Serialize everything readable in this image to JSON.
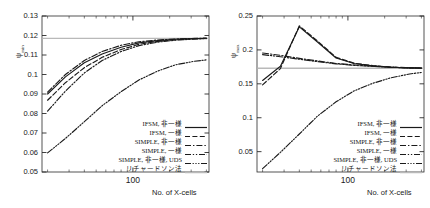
{
  "figure": {
    "panels": [
      {
        "id": "left",
        "ylabel": "ψ",
        "ylabel_sub": "min",
        "xlabel": "No. of X-cells"
      },
      {
        "id": "right",
        "ylabel": "ψ",
        "ylabel_sub": "max",
        "xlabel": "No. of X-cells"
      }
    ]
  },
  "legend": {
    "entries": [
      {
        "label": "IFSM, 非一様",
        "style": "solid"
      },
      {
        "label": "IFSM, 一様",
        "style": "dashed"
      },
      {
        "label": "SIMPLE, 非一様",
        "style": "dashdot"
      },
      {
        "label": "SIMPLE, 一様",
        "style": "dashdotdot"
      },
      {
        "label": "SIMPLE, 非一様, UDS",
        "style": "dashdotdotdot"
      },
      {
        "label": "リチャードソン法",
        "style": "reference"
      }
    ]
  },
  "chart_data": [
    {
      "type": "line",
      "id": "psi-min",
      "title": "",
      "xlabel": "No. of X-cells",
      "ylabel": "ψ_min",
      "xscale": "log",
      "xlim": [
        18,
        420
      ],
      "ylim": [
        0.05,
        0.13
      ],
      "yticks": [
        0.05,
        0.06,
        0.07,
        0.08,
        0.09,
        0.1,
        0.11,
        0.12,
        0.13
      ],
      "ytick_labels": [
        "0.05",
        "0.06",
        "0.07",
        "0.08",
        "0.09",
        "0.1",
        "0.11",
        "0.12",
        "0.13"
      ],
      "xticks": [
        100
      ],
      "xtick_labels": [
        "100"
      ],
      "grid": false,
      "legend_position": "lower-right",
      "reference_line": {
        "value": 0.1185,
        "label": "リチャードソン法"
      },
      "x": [
        20,
        28,
        40,
        56,
        80,
        112,
        160,
        224,
        320,
        400
      ],
      "series": [
        {
          "name": "IFSM, 非一様",
          "style": "solid",
          "values": [
            0.09,
            0.0988,
            0.106,
            0.1105,
            0.114,
            0.1162,
            0.1174,
            0.1181,
            0.1184,
            0.1186
          ]
        },
        {
          "name": "IFSM, 一様",
          "style": "dashed",
          "values": [
            0.0868,
            0.0958,
            0.1035,
            0.1088,
            0.1128,
            0.1155,
            0.117,
            0.1178,
            0.1183,
            0.1185
          ]
        },
        {
          "name": "SIMPLE, 非一様",
          "style": "dashdot",
          "values": [
            0.091,
            0.1,
            0.1072,
            0.1118,
            0.115,
            0.1168,
            0.1177,
            0.1182,
            0.1185,
            0.1187
          ]
        },
        {
          "name": "SIMPLE, 一様",
          "style": "dashdotdot",
          "values": [
            0.0812,
            0.0915,
            0.1008,
            0.1072,
            0.1118,
            0.1148,
            0.1166,
            0.1176,
            0.1182,
            0.1184
          ]
        },
        {
          "name": "SIMPLE, 非一様, UDS",
          "style": "dashdotdotdot",
          "values": [
            0.0598,
            0.0672,
            0.0758,
            0.084,
            0.0912,
            0.0972,
            0.1018,
            0.105,
            0.1068,
            0.1075
          ]
        }
      ]
    },
    {
      "type": "line",
      "id": "psi-max",
      "title": "",
      "xlabel": "No. of X-cells",
      "ylabel": "ψ_max",
      "xscale": "log",
      "xlim": [
        18,
        420
      ],
      "ylim": [
        0.02,
        0.25
      ],
      "yticks": [
        0.05,
        0.1,
        0.15,
        0.2,
        0.25
      ],
      "ytick_labels": [
        "0.05",
        "0.1",
        "0.15",
        "0.2",
        "0.25"
      ],
      "xticks": [
        100
      ],
      "xtick_labels": [
        "100"
      ],
      "grid": false,
      "legend_position": "lower-right",
      "reference_line": {
        "value": 0.173,
        "label": "リチャードソン法"
      },
      "x": [
        20,
        28,
        40,
        56,
        80,
        112,
        160,
        224,
        320,
        400
      ],
      "series": [
        {
          "name": "IFSM, 非一様",
          "style": "solid",
          "values": [
            0.155,
            0.176,
            0.234,
            0.212,
            0.188,
            0.18,
            0.1765,
            0.1745,
            0.1735,
            0.1732
          ]
        },
        {
          "name": "IFSM, 一様",
          "style": "dashed",
          "values": [
            0.1485,
            0.1725,
            0.2355,
            0.2135,
            0.189,
            0.1805,
            0.1768,
            0.1748,
            0.1736,
            0.1733
          ]
        },
        {
          "name": "SIMPLE, 非一様",
          "style": "dashdot",
          "values": [
            0.1955,
            0.192,
            0.1875,
            0.1838,
            0.18,
            0.1778,
            0.176,
            0.1745,
            0.1736,
            0.1733
          ]
        },
        {
          "name": "SIMPLE, 一様",
          "style": "dashdotdot",
          "values": [
            0.193,
            0.19,
            0.1862,
            0.1828,
            0.1795,
            0.1772,
            0.1757,
            0.1743,
            0.1735,
            0.1732
          ]
        },
        {
          "name": "SIMPLE, 非一様, UDS",
          "style": "dashdotdotdot",
          "values": [
            0.025,
            0.049,
            0.076,
            0.102,
            0.1235,
            0.1395,
            0.1508,
            0.1588,
            0.1645,
            0.1668
          ]
        }
      ]
    }
  ]
}
